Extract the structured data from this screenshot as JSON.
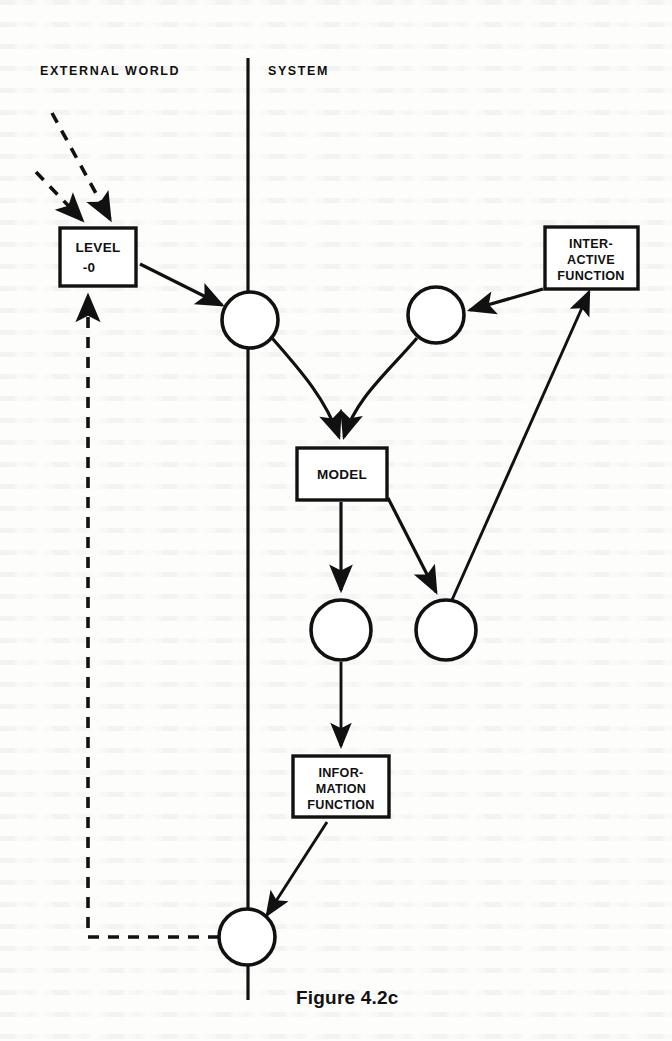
{
  "figure": {
    "caption": "Figure 4.2c",
    "caption_x": 296,
    "caption_y": 1004
  },
  "regions": [
    {
      "id": "external-world",
      "label": "EXTERNAL WORLD",
      "x": 40,
      "y": 75
    },
    {
      "id": "system",
      "label": "SYSTEM",
      "x": 268,
      "y": 75
    }
  ],
  "divider": {
    "name": "system-boundary-line",
    "x": 248,
    "y1": 58,
    "y2": 1000
  },
  "boxes": [
    {
      "id": "level-0",
      "name": "level-0-box",
      "lines": [
        "LEVEL",
        "-0"
      ],
      "x": 60,
      "y": 228,
      "w": 76,
      "h": 58,
      "align": "left",
      "text_x": 98
    },
    {
      "id": "interactive-function",
      "name": "interactive-function-box",
      "lines": [
        "INTER-",
        "ACTIVE",
        "FUNCTION"
      ],
      "x": 545,
      "y": 227,
      "w": 93,
      "h": 62,
      "align": "center",
      "text_x": 591
    },
    {
      "id": "model",
      "name": "model-box",
      "lines": [
        "MODEL"
      ],
      "x": 297,
      "y": 448,
      "w": 90,
      "h": 52,
      "align": "center",
      "text_x": 342
    },
    {
      "id": "information-function",
      "name": "information-function-box",
      "lines": [
        "INFOR-",
        "MATION",
        "FUNCTION"
      ],
      "x": 293,
      "y": 756,
      "w": 96,
      "h": 61,
      "align": "center",
      "text_x": 341
    }
  ],
  "circles": [
    {
      "id": "junction-input",
      "name": "junction-node-input",
      "cx": 250,
      "cy": 320,
      "r": 28
    },
    {
      "id": "junction-interactive",
      "name": "junction-node-interactive",
      "cx": 436,
      "cy": 315,
      "r": 28
    },
    {
      "id": "junction-model-out",
      "name": "junction-node-model-output",
      "cx": 341,
      "cy": 630,
      "r": 30
    },
    {
      "id": "junction-feedback-up",
      "name": "junction-node-feedback-up",
      "cx": 446,
      "cy": 630,
      "r": 30
    },
    {
      "id": "junction-output",
      "name": "junction-node-output",
      "cx": 247,
      "cy": 937,
      "r": 28
    }
  ],
  "connections": [
    {
      "id": "env-in-1",
      "name": "dashed-input-arrow-1",
      "style": "dashed",
      "from": "environment",
      "to": "level-0"
    },
    {
      "id": "env-in-2",
      "name": "dashed-input-arrow-2",
      "style": "dashed",
      "from": "environment",
      "to": "level-0"
    },
    {
      "id": "level0-to-junction",
      "name": "arrow-level0-to-input-junction",
      "style": "solid",
      "from": "level-0",
      "to": "junction-input"
    },
    {
      "id": "junction-to-model",
      "name": "curve-input-junction-to-model",
      "style": "solid",
      "from": "junction-input",
      "to": "model"
    },
    {
      "id": "interactive-junction-to-model",
      "name": "curve-interactive-junction-to-model",
      "style": "solid",
      "from": "junction-interactive",
      "to": "model"
    },
    {
      "id": "interactive-to-junction",
      "name": "arrow-interactive-function-to-junction",
      "style": "solid",
      "from": "interactive-function",
      "to": "junction-interactive"
    },
    {
      "id": "model-to-out-junction",
      "name": "arrow-model-to-output-junction",
      "style": "solid",
      "from": "model",
      "to": "junction-model-out"
    },
    {
      "id": "model-to-feedback-junction",
      "name": "arrow-model-to-feedback-junction",
      "style": "solid",
      "from": "model",
      "to": "junction-feedback-up"
    },
    {
      "id": "feedback-to-interactive",
      "name": "arrow-feedback-junction-to-interactive-function",
      "style": "solid",
      "from": "junction-feedback-up",
      "to": "interactive-function"
    },
    {
      "id": "out-junction-to-info",
      "name": "arrow-output-junction-to-information-function",
      "style": "solid",
      "from": "junction-model-out",
      "to": "information-function"
    },
    {
      "id": "info-to-output",
      "name": "arrow-information-function-to-output-junction",
      "style": "solid",
      "from": "information-function",
      "to": "junction-output"
    },
    {
      "id": "output-to-level0",
      "name": "dashed-feedback-to-level0",
      "style": "dashed",
      "from": "junction-output",
      "to": "level-0"
    }
  ],
  "colors": {
    "ink": "#111111",
    "paper": "#ffffff"
  }
}
